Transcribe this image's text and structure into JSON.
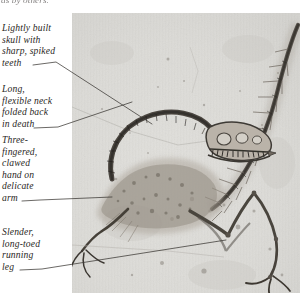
{
  "page": {
    "width": 300,
    "height": 303,
    "background": "#ffffff",
    "clipped_top_text": "as by others."
  },
  "photo": {
    "name": "fossil-photograph",
    "subject": "Archaeopteryx fossil slab",
    "slab_color": "#dcdbd7",
    "bone_color": "#4a4540",
    "x": 72,
    "y": 13,
    "width": 228,
    "height": 280
  },
  "labels": [
    {
      "id": "skull",
      "text": "Lightly built\nskull with\nsharp, spiked\nteeth",
      "leader_from": [
        56,
        62
      ],
      "leader_to": [
        152,
        124
      ]
    },
    {
      "id": "neck",
      "text": "Long,\nflexible neck\nfolded back\nin death",
      "leader_from": [
        58,
        127
      ],
      "leader_to": [
        130,
        104
      ]
    },
    {
      "id": "hand",
      "text": "Three-\nfingered,\nclawed\nhand on\ndelicate\narm",
      "leader_from": [
        40,
        200
      ],
      "leader_to": [
        108,
        197
      ]
    },
    {
      "id": "leg",
      "text": "Slender,\nlong-toed\nrunning\nleg",
      "leader_from": [
        42,
        269
      ],
      "leader_to": [
        224,
        240
      ]
    }
  ],
  "colors": {
    "leader_line": "#3a3733",
    "text": "#2a2724",
    "slab": "#dcdbd7"
  }
}
